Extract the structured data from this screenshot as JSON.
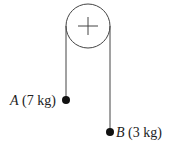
{
  "diagram": {
    "pulley": {
      "cx": 88,
      "cy": 26,
      "r": 22,
      "symbol": "plus"
    },
    "masses": [
      {
        "id": "A",
        "mass": "7 kg",
        "suffix": " (7 kg)",
        "x": 66,
        "y": 100
      },
      {
        "id": "B",
        "mass": "3 kg",
        "suffix": " (3 kg)",
        "x": 110,
        "y": 132
      }
    ],
    "colors": {
      "line": "#333333",
      "mass": "#111111",
      "text": "#222222"
    }
  }
}
